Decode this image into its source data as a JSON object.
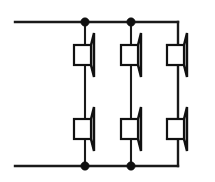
{
  "diagram": {
    "type": "schematic",
    "canvas": {
      "width": 215,
      "height": 182,
      "background": "#ffffff"
    },
    "colors": {
      "wire": "#1a1a1a",
      "symbol_stroke": "#111111",
      "junction": "#101010",
      "background": "#ffffff"
    },
    "buses": [
      {
        "name": "top-bus",
        "label": "",
        "y": 22,
        "x_start": 15,
        "x_end": 178
      },
      {
        "name": "bottom-bus",
        "label": "",
        "y": 166,
        "x_start": 15,
        "x_end": 178
      }
    ],
    "columns": [
      {
        "name": "column-1",
        "x": 85
      },
      {
        "name": "column-2",
        "x": 131
      },
      {
        "name": "column-3",
        "x": 178
      }
    ],
    "rows": [
      {
        "name": "row-top",
        "center_y": 55
      },
      {
        "name": "row-bottom",
        "center_y": 130
      }
    ],
    "junctions": [
      {
        "name": "junction-top-left",
        "x": 85,
        "y": 22,
        "radius": 4.2
      },
      {
        "name": "junction-top-mid",
        "x": 131,
        "y": 22,
        "radius": 4.2
      },
      {
        "name": "junction-bottom-left",
        "x": 85,
        "y": 166,
        "radius": 4.2
      },
      {
        "name": "junction-bottom-mid",
        "x": 131,
        "y": 166,
        "radius": 4.2
      }
    ],
    "speakers": [
      {
        "name": "speaker-1",
        "label": "",
        "column": 1,
        "row": "top",
        "box_x": 74,
        "box_y": 45,
        "box_w": 17,
        "box_h": 20,
        "horn_x": 94,
        "horn_top_y": 33,
        "horn_bottom_y": 77
      },
      {
        "name": "speaker-2",
        "label": "",
        "column": 2,
        "row": "top",
        "box_x": 121,
        "box_y": 45,
        "box_w": 17,
        "box_h": 20,
        "horn_x": 141,
        "horn_top_y": 33,
        "horn_bottom_y": 77
      },
      {
        "name": "speaker-3",
        "label": "",
        "column": 3,
        "row": "top",
        "box_x": 167,
        "box_y": 45,
        "box_w": 17,
        "box_h": 20,
        "horn_x": 187,
        "horn_top_y": 33,
        "horn_bottom_y": 77
      },
      {
        "name": "speaker-4",
        "label": "",
        "column": 1,
        "row": "bottom",
        "box_x": 74,
        "box_y": 119,
        "box_w": 17,
        "box_h": 20,
        "horn_x": 94,
        "horn_top_y": 107,
        "horn_bottom_y": 151
      },
      {
        "name": "speaker-5",
        "label": "",
        "column": 2,
        "row": "bottom",
        "box_x": 121,
        "box_y": 119,
        "box_w": 17,
        "box_h": 20,
        "horn_x": 141,
        "horn_top_y": 107,
        "horn_bottom_y": 151
      },
      {
        "name": "speaker-6",
        "label": "",
        "column": 3,
        "row": "bottom",
        "box_x": 167,
        "box_y": 119,
        "box_w": 17,
        "box_h": 20,
        "horn_x": 187,
        "horn_top_y": 107,
        "horn_bottom_y": 151
      }
    ],
    "annotations": [],
    "legend": []
  }
}
